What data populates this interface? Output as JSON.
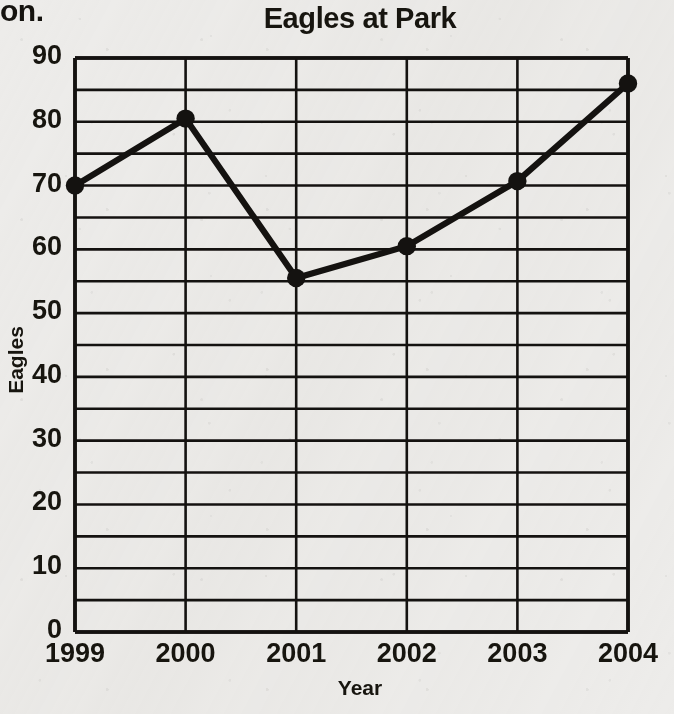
{
  "page": {
    "cutoff_text": "on."
  },
  "chart_data": {
    "type": "line",
    "title": "Eagles at Park",
    "xlabel": "Year",
    "ylabel": "Eagles",
    "categories": [
      "1999",
      "2000",
      "2001",
      "2002",
      "2003",
      "2004"
    ],
    "values": [
      70,
      80.5,
      55.5,
      60.5,
      70.7,
      86
    ],
    "series": [
      {
        "name": "Eagles",
        "values": [
          70,
          80.5,
          55.5,
          60.5,
          70.7,
          86
        ]
      }
    ],
    "ylim": [
      0,
      90
    ],
    "y_major_ticks": [
      0,
      10,
      20,
      30,
      40,
      50,
      60,
      70,
      80,
      90
    ],
    "y_tick_labels": [
      "0",
      "10",
      "20",
      "30",
      "40",
      "50",
      "60",
      "70",
      "80",
      "90"
    ],
    "y_minor_step": 5,
    "grid": true,
    "grid_horizontal": true,
    "grid_vertical": true,
    "legend": "none",
    "line_color": "#141210",
    "marker": "circle",
    "marker_color": "#141210",
    "background_color": "#edecea",
    "axis_color": "#141210"
  }
}
